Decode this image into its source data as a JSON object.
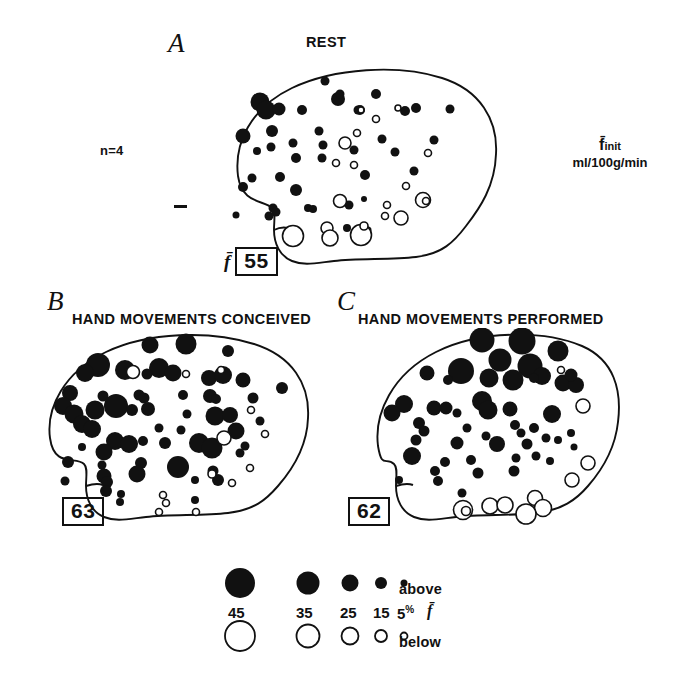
{
  "figure": {
    "type": "rCBF brain activation maps",
    "subject_note": "n=4",
    "units_symbol": "f̄",
    "units_subscript": "init",
    "units_text": "ml/100g/min"
  },
  "panels": [
    {
      "letter": "A",
      "title": "REST",
      "mean_symbol": "f̄",
      "mean_value": "55"
    },
    {
      "letter": "B",
      "title": "HAND MOVEMENTS CONCEIVED",
      "mean_symbol": "",
      "mean_value": "63"
    },
    {
      "letter": "C",
      "title": "HAND MOVEMENTS PERFORMED",
      "mean_symbol": "",
      "mean_value": "62"
    }
  ],
  "legend": {
    "above_label": "above",
    "below_label": "below",
    "mean_symbol": "f̄",
    "percent_sign": "%",
    "sizes": [
      "45",
      "35",
      "25",
      "15",
      "5"
    ]
  },
  "chart_data": {
    "type": "scatter",
    "xlabel": "",
    "ylabel": "",
    "marker_encoding": {
      "filled": "above mean flow",
      "open": "below mean flow",
      "size_scale_percent": [
        45,
        35,
        25,
        15,
        5
      ],
      "size_radius_px": [
        15,
        11.5,
        8.5,
        6,
        3.5
      ]
    },
    "series": [
      {
        "name": "A REST",
        "mean_flow": 55,
        "n": 4,
        "points": [
          [
            95,
            23,
            4.5,
            1
          ],
          [
            30,
            44,
            9.5,
            1
          ],
          [
            36,
            52,
            9.5,
            1
          ],
          [
            49,
            51,
            6.5,
            1
          ],
          [
            72,
            52,
            5.0,
            1
          ],
          [
            108,
            41,
            7.0,
            1
          ],
          [
            110,
            36,
            4.5,
            1
          ],
          [
            128,
            52,
            4.5,
            1
          ],
          [
            146,
            36,
            5.0,
            1
          ],
          [
            175,
            53,
            5.0,
            1
          ],
          [
            186,
            50,
            5.0,
            1
          ],
          [
            220,
            51,
            4.5,
            1
          ],
          [
            13,
            78,
            7.5,
            1
          ],
          [
            41,
            89,
            4.5,
            1
          ],
          [
            27,
            93,
            4.0,
            1
          ],
          [
            42,
            73,
            6.0,
            1
          ],
          [
            89,
            73,
            4.5,
            1
          ],
          [
            93,
            87,
            4.5,
            1
          ],
          [
            63,
            85,
            4.5,
            1
          ],
          [
            152,
            81,
            4.5,
            1
          ],
          [
            124,
            92,
            4.5,
            1
          ],
          [
            165,
            94,
            4.5,
            1
          ],
          [
            204,
            82,
            4.5,
            1
          ],
          [
            92,
            100,
            4.5,
            1
          ],
          [
            22,
            120,
            4.5,
            1
          ],
          [
            13,
            129,
            5.0,
            1
          ],
          [
            50,
            119,
            5.0,
            1
          ],
          [
            66,
            100,
            5.0,
            1
          ],
          [
            66,
            132,
            6.0,
            1
          ],
          [
            135,
            117,
            5.0,
            1
          ],
          [
            184,
            113,
            4.5,
            1
          ],
          [
            43,
            150,
            4.5,
            1
          ],
          [
            46,
            154,
            4.5,
            1
          ],
          [
            39,
            158,
            4.5,
            1
          ],
          [
            6,
            157,
            3.5,
            1
          ],
          [
            78,
            150,
            4.0,
            1
          ],
          [
            83,
            151,
            4.0,
            1
          ],
          [
            119,
            147,
            4.5,
            1
          ],
          [
            117,
            170,
            4.0,
            1
          ],
          [
            138,
            172,
            3.5,
            1
          ],
          [
            134,
            141,
            3.0,
            1
          ],
          [
            130,
            52,
            5.0,
            1
          ],
          [
            131,
            52,
            3.0,
            0
          ],
          [
            168,
            50,
            3.0,
            0
          ],
          [
            146,
            61,
            3.5,
            0
          ],
          [
            127,
            75,
            3.5,
            0
          ],
          [
            115,
            85,
            6.0,
            0
          ],
          [
            106,
            105,
            3.5,
            0
          ],
          [
            124,
            107,
            3.5,
            0
          ],
          [
            198,
            95,
            3.5,
            0
          ],
          [
            176,
            128,
            3.5,
            0
          ],
          [
            157,
            147,
            3.5,
            0
          ],
          [
            155,
            158,
            3.5,
            0
          ],
          [
            110,
            143,
            6.5,
            0
          ],
          [
            171,
            160,
            7.0,
            0
          ],
          [
            193,
            142,
            7.5,
            0
          ],
          [
            196,
            143,
            3.5,
            0
          ],
          [
            97,
            170,
            6.0,
            0
          ],
          [
            100,
            180,
            8.0,
            0
          ],
          [
            63,
            178,
            10.5,
            0
          ],
          [
            131,
            177,
            10.5,
            0
          ],
          [
            134,
            168,
            4.0,
            0
          ]
        ]
      },
      {
        "name": "B HAND MOVEMENTS CONCEIVED",
        "mean_flow": 63,
        "points": [
          [
            110,
            17,
            8.5,
            1
          ],
          [
            146,
            16,
            10.5,
            1
          ],
          [
            188,
            23,
            6.0,
            1
          ],
          [
            58,
            37,
            12.0,
            1
          ],
          [
            85,
            42,
            10.0,
            1
          ],
          [
            45,
            45,
            9.0,
            1
          ],
          [
            119,
            40,
            10.0,
            1
          ],
          [
            133,
            45,
            8.5,
            1
          ],
          [
            107,
            46,
            5.5,
            1
          ],
          [
            169,
            50,
            8.0,
            1
          ],
          [
            183,
            47,
            9.0,
            1
          ],
          [
            203,
            52,
            7.5,
            1
          ],
          [
            242,
            60,
            6.0,
            1
          ],
          [
            30,
            65,
            8.0,
            1
          ],
          [
            63,
            68,
            5.5,
            1
          ],
          [
            99,
            67,
            5.5,
            1
          ],
          [
            104,
            70,
            5.5,
            1
          ],
          [
            143,
            67,
            5.0,
            1
          ],
          [
            170,
            68,
            7.0,
            1
          ],
          [
            176,
            71,
            5.0,
            1
          ],
          [
            213,
            70,
            5.5,
            1
          ],
          [
            23,
            78,
            9.0,
            1
          ],
          [
            76,
            78,
            12.0,
            1
          ],
          [
            55,
            82,
            9.5,
            1
          ],
          [
            34,
            86,
            9.5,
            1
          ],
          [
            92,
            82,
            6.0,
            1
          ],
          [
            108,
            81,
            7.0,
            1
          ],
          [
            147,
            86,
            4.5,
            1
          ],
          [
            175,
            88,
            9.5,
            1
          ],
          [
            190,
            87,
            8.0,
            1
          ],
          [
            220,
            93,
            4.5,
            1
          ],
          [
            42,
            96,
            9.0,
            1
          ],
          [
            52,
            101,
            9.0,
            1
          ],
          [
            196,
            103,
            8.5,
            1
          ],
          [
            119,
            100,
            4.5,
            1
          ],
          [
            141,
            102,
            4.5,
            1
          ],
          [
            75,
            113,
            9.0,
            1
          ],
          [
            89,
            116,
            9.0,
            1
          ],
          [
            103,
            113,
            5.0,
            1
          ],
          [
            125,
            115,
            6.0,
            1
          ],
          [
            159,
            115,
            10.0,
            1
          ],
          [
            172,
            120,
            10.5,
            1
          ],
          [
            205,
            118,
            4.5,
            1
          ],
          [
            200,
            125,
            4.5,
            1
          ],
          [
            42,
            119,
            4.0,
            1
          ],
          [
            64,
            124,
            8.5,
            1
          ],
          [
            28,
            134,
            6.0,
            1
          ],
          [
            62,
            137,
            4.5,
            1
          ],
          [
            101,
            135,
            6.0,
            1
          ],
          [
            138,
            139,
            11.0,
            1
          ],
          [
            97,
            146,
            8.5,
            1
          ],
          [
            64,
            148,
            7.5,
            1
          ],
          [
            173,
            143,
            5.5,
            1
          ],
          [
            178,
            152,
            6.0,
            1
          ],
          [
            25,
            153,
            4.5,
            1
          ],
          [
            67,
            154,
            6.0,
            1
          ],
          [
            66,
            163,
            6.0,
            1
          ],
          [
            155,
            152,
            4.0,
            1
          ],
          [
            81,
            166,
            4.0,
            1
          ],
          [
            155,
            172,
            4.0,
            1
          ],
          [
            80,
            174,
            4.0,
            1
          ],
          [
            93,
            44,
            6.5,
            0
          ],
          [
            146,
            46,
            3.5,
            0
          ],
          [
            181,
            42,
            3.5,
            0
          ],
          [
            211,
            82,
            3.5,
            0
          ],
          [
            225,
            106,
            3.5,
            0
          ],
          [
            184,
            110,
            7.0,
            0
          ],
          [
            210,
            140,
            3.5,
            0
          ],
          [
            192,
            155,
            3.5,
            0
          ],
          [
            123,
            167,
            3.5,
            0
          ],
          [
            126,
            175,
            3.5,
            0
          ],
          [
            119,
            184,
            3.5,
            0
          ],
          [
            156,
            184,
            3.5,
            0
          ],
          [
            172,
            146,
            4.0,
            0
          ]
        ]
      },
      {
        "name": "C HAND MOVEMENTS PERFORMED",
        "mean_flow": 62,
        "points": [
          [
            152,
            12,
            12.5,
            1
          ],
          [
            192,
            13,
            13.5,
            1
          ],
          [
            228,
            23,
            10.5,
            1
          ],
          [
            170,
            32,
            11.5,
            1
          ],
          [
            200,
            38,
            12.5,
            1
          ],
          [
            131,
            43,
            13.0,
            1
          ],
          [
            97,
            45,
            7.5,
            1
          ],
          [
            159,
            50,
            9.5,
            1
          ],
          [
            183,
            52,
            10.5,
            1
          ],
          [
            212,
            48,
            9.0,
            1
          ],
          [
            233,
            55,
            8.5,
            1
          ],
          [
            118,
            52,
            5.0,
            1
          ],
          [
            246,
            57,
            8.0,
            1
          ],
          [
            74,
            76,
            9.0,
            1
          ],
          [
            62,
            85,
            8.5,
            1
          ],
          [
            104,
            80,
            7.5,
            1
          ],
          [
            116,
            80,
            6.5,
            1
          ],
          [
            152,
            73,
            10.0,
            1
          ],
          [
            158,
            82,
            9.5,
            1
          ],
          [
            180,
            81,
            7.5,
            1
          ],
          [
            222,
            86,
            9.0,
            1
          ],
          [
            204,
            50,
            5.0,
            1
          ],
          [
            241,
            47,
            6.5,
            1
          ],
          [
            127,
            85,
            4.5,
            1
          ],
          [
            89,
            95,
            6.0,
            1
          ],
          [
            94,
            103,
            5.5,
            1
          ],
          [
            86,
            112,
            5.5,
            1
          ],
          [
            137,
            100,
            4.5,
            1
          ],
          [
            185,
            97,
            5.0,
            1
          ],
          [
            191,
            105,
            4.5,
            1
          ],
          [
            204,
            100,
            5.0,
            1
          ],
          [
            156,
            108,
            4.5,
            1
          ],
          [
            167,
            116,
            8.0,
            1
          ],
          [
            127,
            115,
            6.5,
            1
          ],
          [
            197,
            116,
            5.5,
            1
          ],
          [
            216,
            110,
            4.5,
            1
          ],
          [
            228,
            112,
            4.0,
            1
          ],
          [
            241,
            105,
            4.0,
            1
          ],
          [
            82,
            128,
            9.0,
            1
          ],
          [
            115,
            134,
            5.0,
            1
          ],
          [
            141,
            132,
            5.0,
            1
          ],
          [
            186,
            130,
            4.5,
            1
          ],
          [
            206,
            128,
            4.5,
            1
          ],
          [
            220,
            133,
            4.0,
            1
          ],
          [
            69,
            152,
            4.0,
            1
          ],
          [
            105,
            143,
            5.0,
            1
          ],
          [
            108,
            153,
            5.0,
            1
          ],
          [
            148,
            145,
            5.5,
            1
          ],
          [
            184,
            143,
            5.5,
            1
          ],
          [
            132,
            165,
            4.5,
            1
          ],
          [
            244,
            119,
            3.5,
            1
          ],
          [
            231,
            42,
            3.5,
            0
          ],
          [
            253,
            78,
            7.0,
            0
          ],
          [
            258,
            135,
            7.0,
            0
          ],
          [
            242,
            152,
            7.0,
            0
          ],
          [
            205,
            170,
            7.5,
            0
          ],
          [
            213,
            180,
            8.5,
            0
          ],
          [
            160,
            178,
            8.0,
            0
          ],
          [
            175,
            177,
            8.0,
            0
          ],
          [
            133,
            182,
            9.5,
            0
          ],
          [
            136,
            183,
            4.5,
            0
          ],
          [
            196,
            186,
            10.0,
            0
          ]
        ]
      }
    ]
  }
}
